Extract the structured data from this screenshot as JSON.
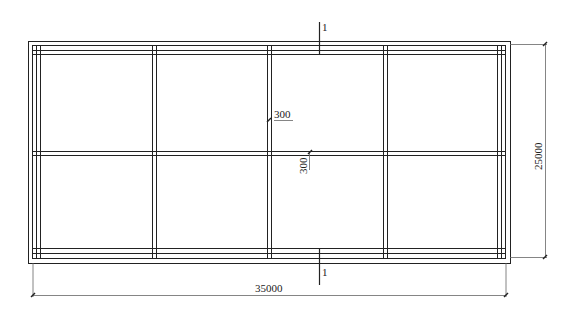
{
  "drawing": {
    "type": "structural floor plan grid",
    "line_color": "#222222",
    "dim_line_color": "#555555",
    "section_marker": {
      "top_label": "1",
      "bottom_label": "1"
    },
    "dimensions": {
      "overall_width": "35000",
      "overall_height": "25000",
      "offset_horizontal": "300",
      "offset_vertical": "300"
    },
    "grid": {
      "bays_x": 4,
      "bays_y": 2
    }
  }
}
